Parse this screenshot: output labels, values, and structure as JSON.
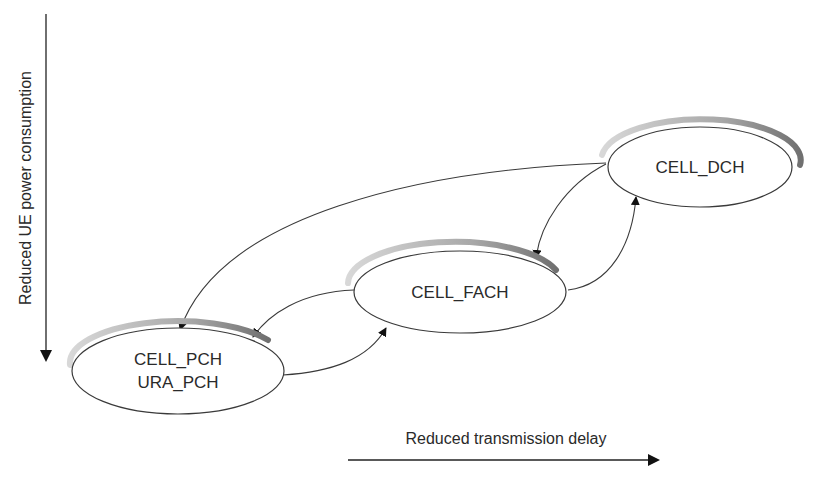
{
  "axes": {
    "vertical_label": "Reduced UE power consumption",
    "horizontal_label": "Reduced transmission delay"
  },
  "states": [
    {
      "id": "cell_dch",
      "lines": [
        "CELL_DCH"
      ]
    },
    {
      "id": "cell_fach",
      "lines": [
        "CELL_FACH"
      ]
    },
    {
      "id": "cell_pch_ura_pch",
      "lines": [
        "CELL_PCH",
        "URA_PCH"
      ]
    }
  ],
  "transitions": [
    {
      "from": "CELL_DCH",
      "to": "CELL_FACH"
    },
    {
      "from": "CELL_FACH",
      "to": "CELL_DCH"
    },
    {
      "from": "CELL_DCH",
      "to": "CELL_PCH / URA_PCH"
    },
    {
      "from": "CELL_FACH",
      "to": "CELL_PCH / URA_PCH"
    },
    {
      "from": "CELL_PCH / URA_PCH",
      "to": "CELL_FACH"
    }
  ],
  "colors": {
    "stroke": "#3a3a3a",
    "shadow": "#a8a8a8",
    "text": "#2a2a2a"
  }
}
